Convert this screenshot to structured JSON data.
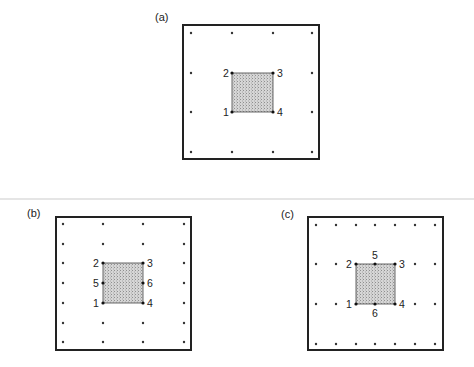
{
  "figure": {
    "divider": {
      "y": 199,
      "color": "#d9d9d9"
    },
    "colors": {
      "frame": "#222222",
      "dot": "#333333",
      "fill": "#cfcfcf",
      "hatch": "#9a9a9a"
    },
    "panels": [
      {
        "id": "a",
        "label": "(a)",
        "label_pos": [
          155,
          21
        ],
        "frame": {
          "x": 183,
          "y": 25,
          "w": 136,
          "h": 134
        },
        "grid": {
          "xs": [
            191,
            232,
            273,
            312
          ],
          "ys": [
            33,
            73,
            112,
            152
          ]
        },
        "element": {
          "x": 232,
          "y": 73,
          "w": 41,
          "h": 39
        },
        "nodes": [
          {
            "id": "1",
            "x": 232,
            "y": 112,
            "label_dx": -9,
            "label_dy": 4
          },
          {
            "id": "2",
            "x": 232,
            "y": 73,
            "label_dx": -9,
            "label_dy": 4
          },
          {
            "id": "3",
            "x": 273,
            "y": 73,
            "label_dx": 4,
            "label_dy": 4
          },
          {
            "id": "4",
            "x": 273,
            "y": 112,
            "label_dx": 4,
            "label_dy": 4
          }
        ]
      },
      {
        "id": "b",
        "label": "(b)",
        "label_pos": [
          27,
          217
        ],
        "frame": {
          "x": 56,
          "y": 217,
          "w": 135,
          "h": 133
        },
        "grid": {
          "xs": [
            63,
            103,
            143,
            184
          ],
          "ys": [
            224,
            244,
            263,
            283,
            303,
            323,
            342
          ]
        },
        "element": {
          "x": 103,
          "y": 263,
          "w": 40,
          "h": 40
        },
        "nodes": [
          {
            "id": "1",
            "x": 103,
            "y": 303,
            "label_dx": -10,
            "label_dy": 4
          },
          {
            "id": "2",
            "x": 103,
            "y": 263,
            "label_dx": -10,
            "label_dy": 4
          },
          {
            "id": "3",
            "x": 143,
            "y": 263,
            "label_dx": 4,
            "label_dy": 4
          },
          {
            "id": "4",
            "x": 143,
            "y": 303,
            "label_dx": 4,
            "label_dy": 4
          },
          {
            "id": "5",
            "x": 103,
            "y": 283,
            "label_dx": -10,
            "label_dy": 4
          },
          {
            "id": "6",
            "x": 143,
            "y": 283,
            "label_dx": 4,
            "label_dy": 4
          }
        ]
      },
      {
        "id": "c",
        "label": "(c)",
        "label_pos": [
          281,
          218
        ],
        "frame": {
          "x": 308,
          "y": 217,
          "w": 135,
          "h": 133
        },
        "grid": {
          "xs": [
            316,
            336,
            356,
            375,
            395,
            415,
            435
          ],
          "ys": [
            225,
            264,
            304,
            344
          ]
        },
        "element": {
          "x": 356,
          "y": 264,
          "w": 39,
          "h": 40
        },
        "nodes": [
          {
            "id": "1",
            "x": 356,
            "y": 304,
            "label_dx": -10,
            "label_dy": 4
          },
          {
            "id": "2",
            "x": 356,
            "y": 264,
            "label_dx": -10,
            "label_dy": 4
          },
          {
            "id": "3",
            "x": 395,
            "y": 264,
            "label_dx": 4,
            "label_dy": 4
          },
          {
            "id": "4",
            "x": 395,
            "y": 304,
            "label_dx": 4,
            "label_dy": 4
          },
          {
            "id": "5",
            "x": 375,
            "y": 264,
            "label_dx": -3,
            "label_dy": -5
          },
          {
            "id": "6",
            "x": 375,
            "y": 304,
            "label_dx": -3,
            "label_dy": 13
          }
        ]
      }
    ]
  }
}
